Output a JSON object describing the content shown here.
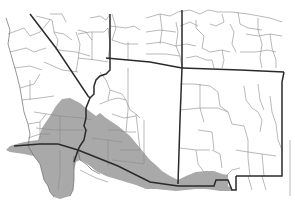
{
  "map": {
    "title": "Species range map — Southwestern North America",
    "range_fill_color": "#a9a9a9",
    "state_line_color": "#2a2a2a",
    "county_line_color": "#8a8a8a",
    "background_color": "#ffffff",
    "regions_depicted": [
      "California",
      "Nevada",
      "Arizona",
      "Utah",
      "Colorado",
      "New Mexico",
      "Baja California",
      "Sonora",
      "Chihuahua"
    ],
    "range_description": "Gray shaded band from southern California and Baja California across southern Nevada and Arizona to southwestern New Mexico and northern Mexico"
  }
}
